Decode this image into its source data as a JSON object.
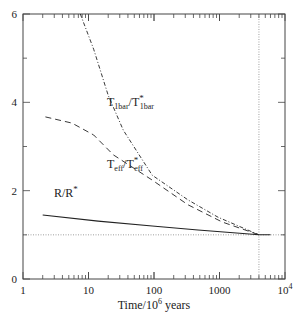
{
  "chart_data": {
    "type": "line",
    "title": "",
    "xlabel": "Time/10^6 years",
    "xlabel_parts": {
      "base": "Time/10",
      "sup": "6",
      "tail": " years"
    },
    "ylabel": "",
    "xscale": "log",
    "xlim": [
      1,
      10000
    ],
    "ylim": [
      0,
      6
    ],
    "x_ticks": [
      {
        "value": 1,
        "label": "1"
      },
      {
        "value": 10,
        "label": "10"
      },
      {
        "value": 100,
        "label": "100"
      },
      {
        "value": 1000,
        "label": "1000"
      },
      {
        "value": 10000,
        "label": "10",
        "sup": "4"
      }
    ],
    "y_ticks": [
      {
        "value": 0,
        "label": "0"
      },
      {
        "value": 2,
        "label": "2"
      },
      {
        "value": 4,
        "label": "4"
      },
      {
        "value": 6,
        "label": "6"
      }
    ],
    "y_minor_ticks": [
      1,
      3,
      5
    ],
    "grid": false,
    "reference_lines": [
      {
        "orientation": "horizontal",
        "value": 1.0,
        "style": "dotted"
      },
      {
        "orientation": "vertical",
        "value": 4000,
        "style": "dotted"
      }
    ],
    "series": [
      {
        "name": "T1bar/T*1bar",
        "label_main": "T",
        "label_sub": "1bar",
        "label_mid": "/T",
        "label_sup": "*",
        "label_sub2": "1bar",
        "style": "dash-dot",
        "label_pos": [
          107,
          106
        ],
        "x": [
          7.5,
          12,
          20,
          34,
          94,
          330,
          950,
          4000
        ],
        "y": [
          6.0,
          5.2,
          4.16,
          3.37,
          2.35,
          1.79,
          1.4,
          1.0
        ]
      },
      {
        "name": "Teff/T*eff",
        "label_main": "T",
        "label_sub": "eff",
        "label_mid": "/T",
        "label_sup": "*",
        "label_sub2": "eff",
        "style": "dashed",
        "label_pos": [
          107,
          168
        ],
        "x": [
          2.2,
          5.6,
          12,
          24,
          94,
          330,
          1100,
          4000
        ],
        "y": [
          3.67,
          3.53,
          3.26,
          2.81,
          2.24,
          1.68,
          1.29,
          1.0
        ]
      },
      {
        "name": "R/R*",
        "label_main": "R/R",
        "label_sup": "*",
        "style": "solid",
        "label_pos": [
          54,
          197
        ],
        "x": [
          2.0,
          14,
          94,
          470,
          4000,
          6000
        ],
        "y": [
          1.45,
          1.31,
          1.2,
          1.11,
          1.0,
          1.0
        ]
      }
    ]
  }
}
